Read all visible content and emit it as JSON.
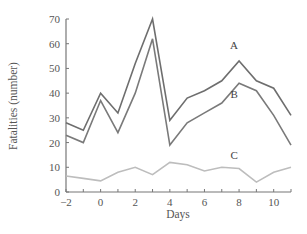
{
  "chart_data": {
    "type": "line",
    "title": "",
    "xlabel": "Days",
    "ylabel": "Fatalities (number)",
    "x": [
      -2,
      -1,
      0,
      1,
      2,
      3,
      4,
      5,
      6,
      7,
      8,
      9,
      10,
      11
    ],
    "xlim": [
      -2,
      11
    ],
    "ylim": [
      0,
      70
    ],
    "x_ticks": [
      -2,
      0,
      2,
      4,
      6,
      8,
      10
    ],
    "x_tick_labels": [
      "−2",
      "0",
      "2",
      "4",
      "6",
      "8",
      "10"
    ],
    "y_ticks": [
      0,
      10,
      20,
      30,
      40,
      50,
      60,
      70
    ],
    "y_tick_labels": [
      "0",
      "10",
      "20",
      "30",
      "40",
      "50",
      "60",
      "70"
    ],
    "grid": false,
    "legend": "inline labels",
    "series": [
      {
        "name": "A",
        "color": "#6e6e6e",
        "values": [
          28,
          25,
          40,
          32,
          52,
          70,
          29,
          38,
          41,
          45,
          53,
          45,
          42,
          31
        ],
        "label_pos": [
          8,
          58
        ]
      },
      {
        "name": "B",
        "color": "#7a7a7a",
        "values": [
          23,
          20,
          37,
          24,
          40,
          62,
          19,
          28,
          32,
          36,
          44,
          41,
          31,
          19
        ],
        "label_pos": [
          8,
          38
        ]
      },
      {
        "name": "C",
        "color": "#bdbdbd",
        "values": [
          6.5,
          5.5,
          4.5,
          8,
          10,
          7,
          12,
          11,
          8.5,
          10,
          9.5,
          4,
          8,
          10
        ],
        "label_pos": [
          8,
          13.5
        ]
      }
    ]
  }
}
